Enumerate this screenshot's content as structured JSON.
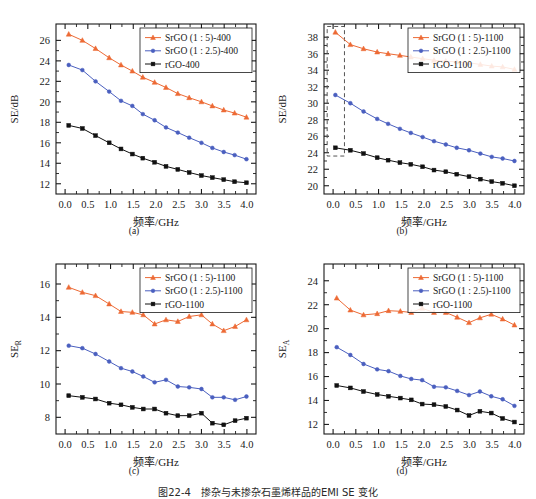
{
  "figure": {
    "caption": "图22-4　掺杂与未掺杂石墨烯样品的EMI SE 变化",
    "top_partial_text": "",
    "background": "#ffffff"
  },
  "colors": {
    "series_srgo_1_5": "#ED6A35",
    "series_srgo_1_25": "#4A5FBF",
    "series_rgo": "#111111",
    "axis": "#1a1a1a",
    "annotation_dashed": "#555555"
  },
  "axis_common": {
    "xlabel": "频率/GHz",
    "xticks": [
      "0.0",
      "0.5",
      "1.0",
      "1.5",
      "2.0",
      "2.5",
      "3.0",
      "3.5",
      "4.0"
    ],
    "xlim": [
      -0.2,
      4.2
    ]
  },
  "panels": [
    {
      "tag": "(a)",
      "ylabel": "SE/dB",
      "ylabel_main": "SE",
      "ylabel_sub": "",
      "ylabel_unit": "/dB",
      "yticks": [
        "12",
        "14",
        "16",
        "18",
        "20",
        "22",
        "24",
        "26"
      ],
      "ylim": [
        11.0,
        27.6
      ],
      "legend": [
        "SrGO (1 : 5)-400",
        "SrGO (1 : 2.5)-400",
        "rGO-400"
      ],
      "has_annotation_box": false
    },
    {
      "tag": "(b)",
      "ylabel": "SE/dB",
      "ylabel_main": "SE",
      "ylabel_sub": "",
      "ylabel_unit": "/dB",
      "yticks": [
        "20",
        "22",
        "24",
        "26",
        "28",
        "30",
        "32",
        "34",
        "36",
        "38"
      ],
      "ylim": [
        19.0,
        39.6
      ],
      "legend": [
        "SrGO (1 : 5)-1100",
        "SrGO (1 : 2.5)-1100",
        "rGO-1100"
      ],
      "has_annotation_box": true,
      "annotation_box": {
        "x0": -0.13,
        "x1": 0.25,
        "y0": 23.6,
        "y1": 39.3
      }
    },
    {
      "tag": "(c)",
      "ylabel": "SE_R",
      "ylabel_main": "SE",
      "ylabel_sub": "R",
      "ylabel_unit": "",
      "yticks": [
        "8",
        "10",
        "12",
        "14",
        "16"
      ],
      "ylim": [
        7.0,
        17.2
      ],
      "legend": [
        "SrGO (1 : 5)-1100",
        "SrGO (1 : 2.5)-1100",
        "rGO-1100"
      ],
      "has_annotation_box": false
    },
    {
      "tag": "(d)",
      "ylabel": "SE_A",
      "ylabel_main": "SE",
      "ylabel_sub": "A",
      "ylabel_unit": "",
      "yticks": [
        "12",
        "14",
        "16",
        "18",
        "20",
        "22",
        "24"
      ],
      "ylim": [
        11.2,
        25.4
      ],
      "legend": [
        "SrGO (1 : 5)-1100",
        "SrGO (1 : 2.5)-1100",
        "rGO-1100"
      ],
      "has_annotation_box": false
    }
  ],
  "chart_data": [
    {
      "type": "line",
      "panel": "(a)",
      "title": "",
      "xlabel": "频率/GHz",
      "ylabel": "SE/dB",
      "xlim": [
        -0.2,
        4.2
      ],
      "ylim": [
        11.0,
        27.6
      ],
      "grid": false,
      "legend_position": "top-right",
      "x": [
        0.08,
        0.38,
        0.67,
        0.97,
        1.23,
        1.48,
        1.71,
        1.97,
        2.22,
        2.48,
        2.73,
        3.0,
        3.24,
        3.49,
        3.73,
        3.99
      ],
      "series": [
        {
          "name": "SrGO (1 : 5)-400",
          "marker": "triangle",
          "color": "#ED6A35",
          "values": [
            26.6,
            26.0,
            25.2,
            24.3,
            23.6,
            23.0,
            22.4,
            21.9,
            21.4,
            20.8,
            20.4,
            20.0,
            19.6,
            19.2,
            18.9,
            18.5
          ]
        },
        {
          "name": "SrGO (1 : 2.5)-400",
          "marker": "circle",
          "color": "#4A5FBF",
          "values": [
            23.6,
            23.1,
            22.0,
            21.0,
            20.1,
            19.6,
            18.8,
            18.2,
            17.5,
            17.0,
            16.5,
            16.0,
            15.5,
            15.1,
            14.8,
            14.4
          ]
        },
        {
          "name": "rGO-400",
          "marker": "square",
          "color": "#111111",
          "values": [
            17.7,
            17.4,
            16.7,
            16.0,
            15.4,
            14.9,
            14.5,
            14.1,
            13.7,
            13.4,
            13.1,
            12.8,
            12.6,
            12.4,
            12.2,
            12.1
          ]
        }
      ]
    },
    {
      "type": "line",
      "panel": "(b)",
      "title": "",
      "xlabel": "频率/GHz",
      "ylabel": "SE/dB",
      "xlim": [
        -0.2,
        4.2
      ],
      "ylim": [
        19.0,
        39.6
      ],
      "grid": false,
      "legend_position": "top-right",
      "annotation": "dashed rectangle highlighting low-frequency region",
      "x": [
        0.05,
        0.38,
        0.67,
        0.97,
        1.21,
        1.47,
        1.71,
        1.97,
        2.22,
        2.48,
        2.72,
        2.99,
        3.24,
        3.49,
        3.73,
        3.99
      ],
      "series": [
        {
          "name": "SrGO (1 : 5)-1100",
          "marker": "triangle",
          "color": "#ED6A35",
          "values": [
            38.6,
            37.1,
            36.6,
            36.2,
            36.0,
            35.8,
            35.6,
            35.4,
            35.2,
            35.1,
            35.0,
            34.9,
            34.7,
            34.5,
            34.4,
            34.1
          ]
        },
        {
          "name": "SrGO (1 : 2.5)-1100",
          "marker": "circle",
          "color": "#4A5FBF",
          "values": [
            31.0,
            30.0,
            29.0,
            28.1,
            27.5,
            26.9,
            26.4,
            25.9,
            25.4,
            25.0,
            24.6,
            24.3,
            23.9,
            23.5,
            23.3,
            23.0
          ]
        },
        {
          "name": "rGO-1100",
          "marker": "square",
          "color": "#111111",
          "values": [
            24.6,
            24.3,
            23.9,
            23.4,
            23.1,
            22.8,
            22.6,
            22.3,
            21.9,
            21.7,
            21.4,
            21.1,
            20.8,
            20.5,
            20.3,
            20.0
          ]
        }
      ]
    },
    {
      "type": "line",
      "panel": "(c)",
      "title": "",
      "xlabel": "频率/GHz",
      "ylabel": "SE_R",
      "xlim": [
        -0.2,
        4.2
      ],
      "ylim": [
        7.0,
        17.2
      ],
      "grid": false,
      "legend_position": "top-right",
      "x": [
        0.08,
        0.38,
        0.67,
        0.97,
        1.23,
        1.48,
        1.72,
        1.97,
        2.22,
        2.48,
        2.73,
        3.0,
        3.24,
        3.49,
        3.74,
        3.99
      ],
      "series": [
        {
          "name": "SrGO (1 : 5)-1100",
          "marker": "triangle",
          "color": "#ED6A35",
          "values": [
            15.8,
            15.5,
            15.3,
            14.8,
            14.35,
            14.3,
            14.15,
            13.6,
            13.85,
            13.75,
            14.05,
            14.15,
            13.6,
            13.2,
            13.45,
            13.85
          ]
        },
        {
          "name": "SrGO (1 : 2.5)-1100",
          "marker": "circle",
          "color": "#4A5FBF",
          "values": [
            12.3,
            12.15,
            11.8,
            11.35,
            10.95,
            10.75,
            10.45,
            10.1,
            10.25,
            9.85,
            9.8,
            9.7,
            9.2,
            9.2,
            9.05,
            9.25
          ]
        },
        {
          "name": "rGO-1100",
          "marker": "square",
          "color": "#111111",
          "values": [
            9.3,
            9.2,
            9.1,
            8.85,
            8.75,
            8.6,
            8.5,
            8.5,
            8.25,
            8.1,
            8.1,
            8.25,
            7.65,
            7.55,
            7.8,
            7.95
          ]
        }
      ]
    },
    {
      "type": "line",
      "panel": "(d)",
      "title": "",
      "xlabel": "频率/GHz",
      "ylabel": "SE_A",
      "xlim": [
        -0.2,
        4.2
      ],
      "ylim": [
        11.2,
        25.4
      ],
      "grid": false,
      "legend_position": "top-right",
      "x": [
        0.08,
        0.38,
        0.67,
        0.97,
        1.22,
        1.48,
        1.72,
        1.96,
        2.22,
        2.48,
        2.73,
        2.99,
        3.23,
        3.48,
        3.73,
        3.99
      ],
      "series": [
        {
          "name": "SrGO (1 : 5)-1100",
          "marker": "triangle",
          "color": "#ED6A35",
          "values": [
            22.55,
            21.55,
            21.15,
            21.25,
            21.5,
            21.45,
            21.35,
            21.7,
            21.35,
            21.35,
            20.95,
            20.5,
            20.9,
            21.2,
            20.8,
            20.3
          ]
        },
        {
          "name": "SrGO (1 : 2.5)-1100",
          "marker": "circle",
          "color": "#4A5FBF",
          "values": [
            18.45,
            17.8,
            17.05,
            16.6,
            16.45,
            16.05,
            15.8,
            15.7,
            15.15,
            15.1,
            14.8,
            14.45,
            14.75,
            14.35,
            14.1,
            13.55
          ]
        },
        {
          "name": "rGO-1100",
          "marker": "square",
          "color": "#111111",
          "values": [
            15.25,
            15.05,
            14.75,
            14.5,
            14.35,
            14.2,
            14.05,
            13.7,
            13.65,
            13.5,
            13.2,
            12.75,
            13.1,
            12.95,
            12.5,
            12.2
          ]
        }
      ]
    }
  ]
}
